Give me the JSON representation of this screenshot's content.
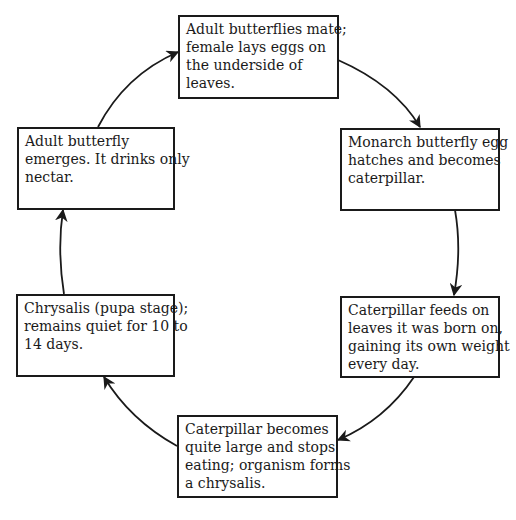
{
  "diagram": {
    "type": "cycle",
    "title": "",
    "stages": [
      {
        "id": "mate",
        "lines": [
          "Adult butterflies mate;",
          "female lays eggs on",
          "the underside of",
          "leaves."
        ]
      },
      {
        "id": "egg",
        "lines": [
          "Monarch butterfly egg",
          "hatches and becomes",
          "caterpillar."
        ]
      },
      {
        "id": "feed",
        "lines": [
          "Caterpillar feeds on",
          "leaves it was born on,",
          "gaining its own weight",
          "every day."
        ]
      },
      {
        "id": "large",
        "lines": [
          "Caterpillar becomes",
          "quite large and stops",
          "eating; organism forms",
          "a chrysalis."
        ]
      },
      {
        "id": "chrysalis",
        "lines": [
          "Chrysalis (pupa stage);",
          "remains quiet for 10 to",
          "14 days."
        ]
      },
      {
        "id": "emerge",
        "lines": [
          "Adult butterfly",
          "emerges. It drinks only",
          "nectar."
        ]
      }
    ],
    "arrows": [
      {
        "from": "mate",
        "to": "egg"
      },
      {
        "from": "egg",
        "to": "feed"
      },
      {
        "from": "feed",
        "to": "large"
      },
      {
        "from": "large",
        "to": "chrysalis"
      },
      {
        "from": "chrysalis",
        "to": "emerge"
      },
      {
        "from": "emerge",
        "to": "mate"
      }
    ],
    "colors": {
      "stroke": "#1a1a1a",
      "background": "#ffffff"
    }
  }
}
